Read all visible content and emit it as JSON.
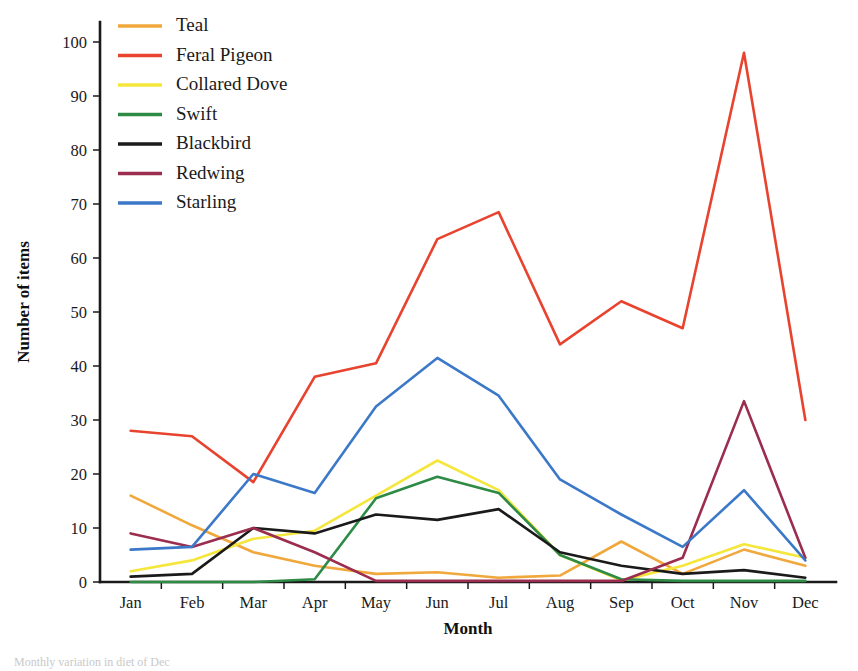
{
  "chart_data": {
    "type": "line",
    "title": "",
    "xlabel": "Month",
    "ylabel": "Number of items",
    "categories": [
      "Jan",
      "Feb",
      "Mar",
      "Apr",
      "May",
      "Jun",
      "Jul",
      "Aug",
      "Sep",
      "Oct",
      "Nov",
      "Dec"
    ],
    "ylim": [
      0,
      100
    ],
    "yticks": [
      0,
      10,
      20,
      30,
      40,
      50,
      60,
      70,
      80,
      90,
      100
    ],
    "grid": false,
    "legend_position": "top-left",
    "series": [
      {
        "name": "Teal",
        "color": "#F0A83C",
        "values": [
          16.0,
          10.5,
          5.5,
          3.0,
          1.5,
          1.8,
          0.8,
          1.2,
          7.5,
          1.5,
          6.0,
          3.0
        ]
      },
      {
        "name": "Feral Pigeon",
        "color": "#E8432E",
        "values": [
          28.0,
          27.0,
          18.5,
          38.0,
          40.5,
          63.5,
          68.5,
          44.0,
          52.0,
          47.0,
          98.0,
          30.0
        ]
      },
      {
        "name": "Collared Dove",
        "color": "#F5E63C",
        "values": [
          2.0,
          4.0,
          8.0,
          9.5,
          16.0,
          22.5,
          17.0,
          5.0,
          0.3,
          3.0,
          7.0,
          4.5
        ]
      },
      {
        "name": "Swift",
        "color": "#2D8B45",
        "values": [
          0.0,
          0.0,
          0.0,
          0.5,
          15.5,
          19.5,
          16.5,
          5.0,
          0.5,
          0.2,
          0.2,
          0.2
        ]
      },
      {
        "name": "Blackbird",
        "color": "#1A1A1A",
        "values": [
          1.0,
          1.5,
          10.0,
          9.0,
          12.5,
          11.5,
          13.5,
          5.5,
          3.0,
          1.5,
          2.2,
          0.8
        ]
      },
      {
        "name": "Redwing",
        "color": "#9B2D4F",
        "values": [
          9.0,
          6.5,
          10.0,
          5.5,
          0.2,
          0.2,
          0.2,
          0.2,
          0.2,
          4.5,
          33.5,
          4.5
        ]
      },
      {
        "name": "Starling",
        "color": "#3C78C8",
        "values": [
          6.0,
          6.5,
          20.0,
          16.5,
          32.5,
          41.5,
          34.5,
          19.0,
          12.5,
          6.5,
          17.0,
          4.0
        ]
      }
    ]
  },
  "legend": {
    "items": [
      {
        "label": "Teal",
        "color": "#F0A83C"
      },
      {
        "label": "Feral Pigeon",
        "color": "#E8432E"
      },
      {
        "label": "Collared Dove",
        "color": "#F5E63C"
      },
      {
        "label": "Swift",
        "color": "#2D8B45"
      },
      {
        "label": "Blackbird",
        "color": "#1A1A1A"
      },
      {
        "label": "Redwing",
        "color": "#9B2D4F"
      },
      {
        "label": "Starling",
        "color": "#3C78C8"
      }
    ]
  },
  "axes": {
    "y_title": "Number of items",
    "x_title": "Month"
  },
  "caption": {
    "text": "Monthly variation in diet of Dec"
  }
}
